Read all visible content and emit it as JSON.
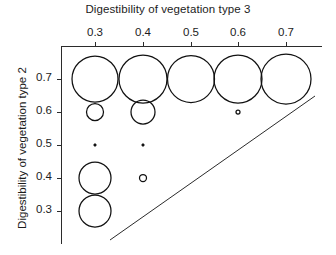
{
  "chart_data": {
    "type": "scatter",
    "title": "Digestibility of vegetation type 3",
    "xlabel": "Digestibility of vegetation type 3",
    "ylabel": "Digestibility of vegetation type 2",
    "xlim": [
      0.25,
      0.75
    ],
    "ylim": [
      0.25,
      0.75
    ],
    "xticks": [
      0.3,
      0.4,
      0.5,
      0.6,
      0.7
    ],
    "xtick_labels": [
      "0.3",
      "0.4",
      "0.5",
      "0.6",
      "0.7"
    ],
    "yticks": [
      0.3,
      0.4,
      0.5,
      0.6,
      0.7
    ],
    "ytick_labels": [
      "0.7",
      "0.6",
      "0.5",
      "0.4",
      "0.3"
    ],
    "x_axis_position": "top",
    "grid": false,
    "legend": false,
    "marker": "open-circle",
    "size_encoding": "bubble radius proportional to value",
    "points": [
      {
        "x": 0.3,
        "y": 0.7,
        "r": 23.0
      },
      {
        "x": 0.4,
        "y": 0.7,
        "r": 24.0
      },
      {
        "x": 0.5,
        "y": 0.7,
        "r": 23.5
      },
      {
        "x": 0.6,
        "y": 0.7,
        "r": 24.0
      },
      {
        "x": 0.7,
        "y": 0.7,
        "r": 25.0
      },
      {
        "x": 0.3,
        "y": 0.6,
        "r": 8.5
      },
      {
        "x": 0.4,
        "y": 0.6,
        "r": 12.0
      },
      {
        "x": 0.6,
        "y": 0.6,
        "r": 2.0
      },
      {
        "x": 0.3,
        "y": 0.5,
        "r": 1.2
      },
      {
        "x": 0.4,
        "y": 0.5,
        "r": 1.2
      },
      {
        "x": 0.3,
        "y": 0.4,
        "r": 16.0
      },
      {
        "x": 0.4,
        "y": 0.4,
        "r": 3.5
      },
      {
        "x": 0.3,
        "y": 0.3,
        "r": 16.0
      }
    ],
    "reference_line": {
      "description": "diagonal boundary line",
      "from": [
        0.355,
        0.268
      ],
      "to": [
        0.785,
        0.712
      ]
    },
    "annotations": []
  },
  "geometry": {
    "axis": {
      "top_y": 46,
      "left_x": 61,
      "right_x": 322,
      "bottom_y": 244
    },
    "x_pixels": [
      95,
      143,
      191,
      238,
      286
    ],
    "y_pixels": [
      79,
      112,
      145,
      178,
      211
    ],
    "bubbles_px": [
      {
        "cx": 95,
        "cy": 79,
        "r": 23.0,
        "name": "bubble-0.3-0.7"
      },
      {
        "cx": 143,
        "cy": 79,
        "r": 24.0,
        "name": "bubble-0.4-0.7"
      },
      {
        "cx": 191,
        "cy": 79,
        "r": 23.5,
        "name": "bubble-0.5-0.7"
      },
      {
        "cx": 238,
        "cy": 79,
        "r": 24.0,
        "name": "bubble-0.6-0.7"
      },
      {
        "cx": 286,
        "cy": 79,
        "r": 25.0,
        "name": "bubble-0.7-0.7"
      },
      {
        "cx": 95,
        "cy": 112,
        "r": 8.5,
        "name": "bubble-0.3-0.6"
      },
      {
        "cx": 143,
        "cy": 112,
        "r": 12.0,
        "name": "bubble-0.4-0.6"
      },
      {
        "cx": 238,
        "cy": 112,
        "r": 2.0,
        "name": "bubble-0.6-0.6"
      },
      {
        "cx": 95,
        "cy": 145,
        "r": 1.2,
        "name": "bubble-0.3-0.5"
      },
      {
        "cx": 143,
        "cy": 145,
        "r": 1.2,
        "name": "bubble-0.4-0.5"
      },
      {
        "cx": 95,
        "cy": 178,
        "r": 16.0,
        "name": "bubble-0.3-0.4"
      },
      {
        "cx": 143,
        "cy": 178,
        "r": 3.5,
        "name": "bubble-0.4-0.4"
      },
      {
        "cx": 95,
        "cy": 211,
        "r": 16.0,
        "name": "bubble-0.3-0.3"
      }
    ],
    "reference_line_px": {
      "x1": 110,
      "y1": 240,
      "x2": 315,
      "y2": 96
    }
  },
  "colors": {
    "background": "#ffffff",
    "ink": "#111111",
    "axis": "#2b2b2b",
    "text": "#1c1c1c"
  }
}
